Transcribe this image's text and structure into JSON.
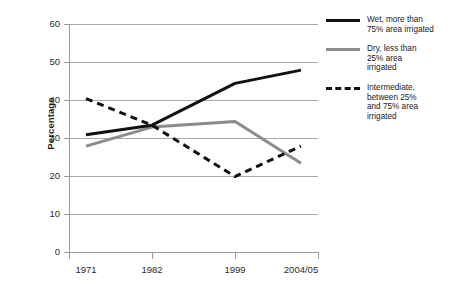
{
  "chart_data": {
    "type": "line",
    "title": "",
    "xlabel": "",
    "ylabel": "Percentage",
    "categories": [
      "1971",
      "1982",
      "1999",
      "2004/05"
    ],
    "ylim": [
      0,
      60
    ],
    "yticks": [
      0,
      10,
      20,
      30,
      40,
      50,
      60
    ],
    "grid": true,
    "legend_position": "right",
    "series": [
      {
        "name": "Wet, more than 75% area irrigated",
        "style": "solid",
        "color": "#111111",
        "values": [
          31,
          33.5,
          44.5,
          48
        ]
      },
      {
        "name": "Dry, less than 25% area irrigated",
        "style": "solid",
        "color": "#8c8c8c",
        "values": [
          28,
          33,
          34.5,
          23.5
        ]
      },
      {
        "name": "Intermediate, between 25% and 75% area irrigated",
        "style": "dashed",
        "color": "#111111",
        "values": [
          40.5,
          33.5,
          20,
          28
        ]
      }
    ]
  },
  "axis": {
    "ylabel": "Percentage",
    "yticks": [
      "60",
      "50",
      "40",
      "30",
      "20",
      "10",
      "0"
    ],
    "xticks": [
      "1971",
      "1982",
      "1999",
      "2004/05"
    ]
  },
  "legend": {
    "items": [
      {
        "swatch": "solid-black-line-icon",
        "line1": "Wet, more than",
        "line2": "75% area irrigated",
        "line3": "",
        "line4": ""
      },
      {
        "swatch": "solid-gray-line-icon",
        "line1": "Dry, less than",
        "line2": "25% area",
        "line3": "irrigated",
        "line4": ""
      },
      {
        "swatch": "dashed-black-line-icon",
        "line1": "Intermediate,",
        "line2": "between 25%",
        "line3": "and 75% area",
        "line4": "irrigated"
      }
    ]
  },
  "colors": {
    "series_wet": "#111111",
    "series_dry": "#8c8c8c",
    "series_intermediate": "#111111",
    "grid": "#a9a9a9",
    "axis": "#9a9a9a",
    "background": "#ffffff"
  }
}
